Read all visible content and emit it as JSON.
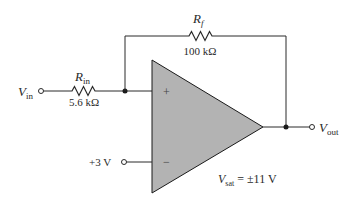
{
  "diagram": {
    "type": "op-amp comparator circuit",
    "components": {
      "rin": {
        "symbol": "R",
        "subscript": "in",
        "value": "5.6 kΩ"
      },
      "rf": {
        "symbol": "R",
        "subscript": "f",
        "value": "100 kΩ"
      },
      "opamp": {
        "plus_label": "+",
        "minus_label": "−",
        "fill": "#b3b3b3"
      }
    },
    "terminals": {
      "vin": {
        "symbol": "V",
        "subscript": "in"
      },
      "vout": {
        "symbol": "V",
        "subscript": "out"
      },
      "vref": {
        "label": "+3 V"
      }
    },
    "annotation": {
      "symbol": "V",
      "subscript": "sat",
      "value": " = ±11 V"
    },
    "colors": {
      "wire": "#2a2a2a",
      "opamp_fill": "#b3b3b3",
      "background": "#ffffff"
    }
  }
}
